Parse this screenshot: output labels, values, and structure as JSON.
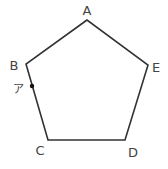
{
  "diagram": {
    "shape": "regular pentagon",
    "stroke_color": "#333333",
    "vertices": [
      {
        "label": "A",
        "x": 87,
        "y": 20,
        "label_x": 87,
        "label_y": 15
      },
      {
        "label": "B",
        "x": 26,
        "y": 64,
        "label_x": 14,
        "label_y": 70
      },
      {
        "label": "C",
        "x": 48,
        "y": 140,
        "label_x": 40,
        "label_y": 155
      },
      {
        "label": "D",
        "x": 125,
        "y": 140,
        "label_x": 133,
        "label_y": 157
      },
      {
        "label": "E",
        "x": 148,
        "y": 65,
        "label_x": 156,
        "label_y": 72
      }
    ],
    "point": {
      "label": "ア",
      "x": 32,
      "y": 86,
      "label_x": 18,
      "label_y": 93,
      "on_edge": "BC"
    }
  }
}
